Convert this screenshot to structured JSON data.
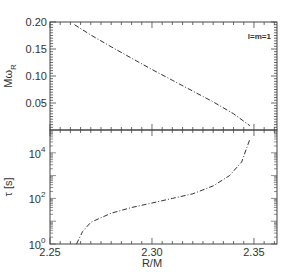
{
  "chart_data": [
    {
      "type": "line",
      "panel": "top",
      "ylabel": "Mω_R",
      "ylabel_main": "Mω",
      "ylabel_sub": "R",
      "xlabel": "",
      "xlim": [
        2.25,
        2.3613
      ],
      "ylim": [
        0.0,
        0.2
      ],
      "yticks": [
        0.05,
        0.1,
        0.15,
        0.2
      ],
      "ytick_labels": [
        "0.05",
        "0.10",
        "0.15",
        "0.20"
      ],
      "annotation": "l=m=1",
      "line_style": "dash-dot",
      "series": [
        {
          "name": "Mω_R",
          "x": [
            2.262,
            2.27,
            2.28,
            2.29,
            2.3,
            2.31,
            2.32,
            2.33,
            2.34,
            2.348
          ],
          "y": [
            0.195,
            0.176,
            0.154,
            0.133,
            0.112,
            0.092,
            0.072,
            0.052,
            0.03,
            0.008
          ]
        }
      ]
    },
    {
      "type": "line",
      "panel": "bottom",
      "ylabel": "τ [s]",
      "xlabel": "R/M",
      "xlim": [
        2.25,
        2.3613
      ],
      "ylim_log10": [
        0,
        5
      ],
      "yscale": "log",
      "xticks": [
        2.25,
        2.3,
        2.35
      ],
      "xtick_labels": [
        "2.25",
        "2.30",
        "2.35"
      ],
      "yticks": [
        1,
        100,
        10000
      ],
      "ytick_labels": [
        {
          "base": "10",
          "exp": "0"
        },
        {
          "base": "10",
          "exp": "2"
        },
        {
          "base": "10",
          "exp": "4"
        }
      ],
      "line_style": "dash-dot",
      "series": [
        {
          "name": "τ",
          "x": [
            2.263,
            2.266,
            2.27,
            2.28,
            2.29,
            2.3,
            2.31,
            2.32,
            2.33,
            2.338,
            2.344,
            2.348
          ],
          "log10_y": [
            0.0,
            0.55,
            0.95,
            1.35,
            1.6,
            1.8,
            2.0,
            2.2,
            2.55,
            3.0,
            3.6,
            4.6
          ]
        }
      ]
    }
  ]
}
